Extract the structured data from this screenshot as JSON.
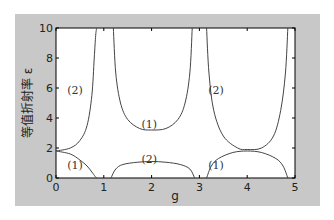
{
  "chart_data": {
    "type": "line",
    "title": "",
    "xlabel": "g",
    "ylabel": "等值折射率 ε",
    "xlim": [
      0,
      5
    ],
    "ylim": [
      0,
      10
    ],
    "xticks": [
      "0",
      "1",
      "2",
      "3",
      "4",
      "5"
    ],
    "yticks": [
      "0",
      "2",
      "4",
      "6",
      "8",
      "10"
    ],
    "grid": false,
    "annotations": [
      {
        "text": "(2)",
        "x": 0.4,
        "y": 5.9
      },
      {
        "text": "(1)",
        "x": 0.4,
        "y": 0.9
      },
      {
        "text": "(1)",
        "x": 1.95,
        "y": 3.6
      },
      {
        "text": "(2)",
        "x": 1.95,
        "y": 1.3
      },
      {
        "text": "(2)",
        "x": 3.35,
        "y": 5.9
      },
      {
        "text": "(1)",
        "x": 3.35,
        "y": 0.9
      }
    ],
    "series": [
      {
        "name": "(2) branch 0-0.85",
        "x": [
          0,
          0.3,
          0.5,
          0.65,
          0.75,
          0.8,
          0.83,
          0.85
        ],
        "y": [
          1.8,
          2.0,
          2.5,
          3.5,
          5.5,
          8,
          9.5,
          10
        ]
      },
      {
        "name": "(1) branch 0-0.85",
        "x": [
          0,
          0.3,
          0.5,
          0.65,
          0.75,
          0.82,
          0.85
        ],
        "y": [
          1.8,
          1.6,
          1.2,
          0.8,
          0.4,
          0.1,
          0
        ]
      },
      {
        "name": "(1) upper 1.2-2.85",
        "x": [
          1.2,
          1.25,
          1.35,
          1.5,
          1.75,
          2.0,
          2.3,
          2.55,
          2.7,
          2.8,
          2.85
        ],
        "y": [
          10,
          7,
          5,
          3.9,
          3.3,
          3.2,
          3.3,
          3.9,
          5,
          7,
          10
        ]
      },
      {
        "name": "(2) lower 1.15-2.9",
        "x": [
          1.15,
          1.25,
          1.4,
          1.7,
          2.0,
          2.3,
          2.6,
          2.8,
          2.9
        ],
        "y": [
          0,
          0.6,
          0.9,
          1.05,
          1.1,
          1.05,
          0.9,
          0.6,
          0
        ]
      },
      {
        "name": "(2) branch 3.15-4.85",
        "x": [
          3.15,
          3.2,
          3.3,
          3.5,
          3.8,
          4.0,
          4.3,
          4.55,
          4.7,
          4.8,
          4.85
        ],
        "y": [
          10,
          7,
          4.5,
          2.8,
          2.0,
          1.9,
          2.0,
          2.8,
          4.5,
          7,
          10
        ]
      },
      {
        "name": "(1) branch 3.15-4.85",
        "x": [
          3.15,
          3.25,
          3.4,
          3.7,
          4.0,
          4.3,
          4.6,
          4.75,
          4.85
        ],
        "y": [
          0,
          0.8,
          1.3,
          1.7,
          1.8,
          1.7,
          1.3,
          0.8,
          0
        ]
      }
    ]
  }
}
